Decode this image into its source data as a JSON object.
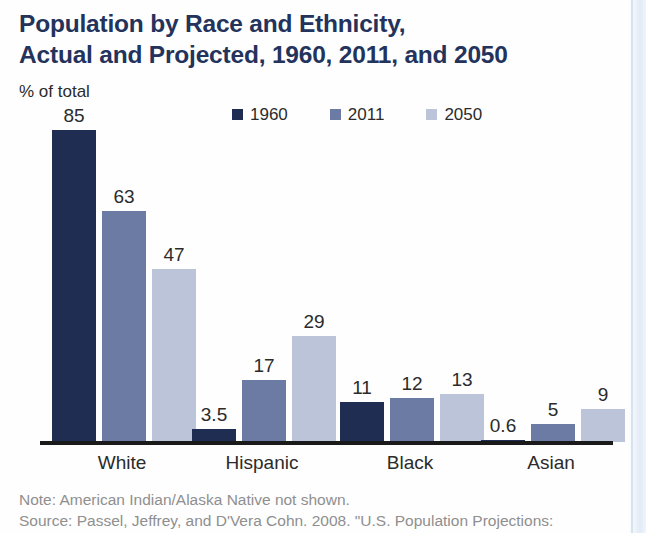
{
  "chart_data": {
    "type": "bar",
    "title": "Population by Race and Ethnicity, Actual and Projected, 1960, 2011, and 2050",
    "title_lines": [
      "Population by Race and Ethnicity,",
      "Actual and Projected, 1960, 2011, and 2050"
    ],
    "ylabel": "% of total",
    "xlabel": "",
    "ylim": [
      0,
      85
    ],
    "grid": false,
    "legend_position": "top-center",
    "categories": [
      "White",
      "Hispanic",
      "Black",
      "Asian"
    ],
    "series": [
      {
        "name": "1960",
        "color": "#1f2d52",
        "values": [
          85,
          3.5,
          11,
          0.6
        ],
        "labels": [
          "85",
          "3.5",
          "11",
          "0.6"
        ]
      },
      {
        "name": "2011",
        "color": "#6b7ba3",
        "values": [
          63,
          17,
          12,
          5
        ],
        "labels": [
          "63",
          "17",
          "12",
          "5"
        ]
      },
      {
        "name": "2050",
        "color": "#bcc4da",
        "values": [
          47,
          29,
          13,
          9
        ],
        "labels": [
          "47",
          "29",
          "13",
          "9"
        ]
      }
    ],
    "notes": [
      "Note: American Indian/Alaska Native not shown.",
      "Source: Passel, Jeffrey, and D'Vera Cohn. 2008. \"U.S. Population Projections:"
    ]
  },
  "colors": {
    "title": "#23335c",
    "text": "#2b2b2b",
    "note": "#8f8f8f",
    "axis": "#1a1a1a",
    "series_1960": "#1f2d52",
    "series_2011": "#6b7ba3",
    "series_2050": "#bcc4da"
  }
}
